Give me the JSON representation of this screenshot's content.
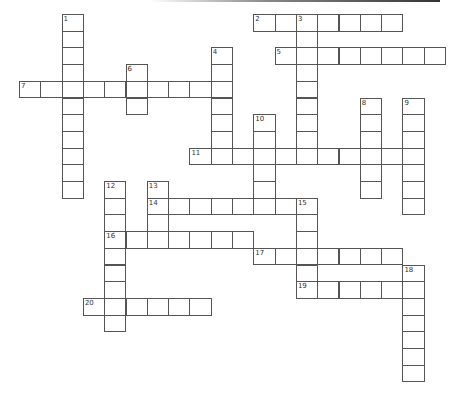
{
  "puzzle": {
    "type": "crossword",
    "grid": {
      "origin_x": 19,
      "origin_y": 14,
      "cell_w": 21.3,
      "cell_h": 16.7
    },
    "colors": {
      "border": "#555555",
      "cell_bg": "#ffffff",
      "number": "#333333"
    },
    "entries": [
      {
        "number": "1",
        "direction": "down",
        "row": 0,
        "col": 2,
        "length": 11
      },
      {
        "number": "2",
        "direction": "across",
        "row": 0,
        "col": 11,
        "length": 7
      },
      {
        "number": "3",
        "direction": "down",
        "row": 0,
        "col": 13,
        "length": 9
      },
      {
        "number": "4",
        "direction": "down",
        "row": 2,
        "col": 9,
        "length": 7
      },
      {
        "number": "5",
        "direction": "across",
        "row": 2,
        "col": 12,
        "length": 8
      },
      {
        "number": "6",
        "direction": "down",
        "row": 3,
        "col": 5,
        "length": 3
      },
      {
        "number": "7",
        "direction": "across",
        "row": 4,
        "col": 0,
        "length": 10
      },
      {
        "number": "8",
        "direction": "down",
        "row": 5,
        "col": 16,
        "length": 6
      },
      {
        "number": "9",
        "direction": "down",
        "row": 5,
        "col": 18,
        "length": 7
      },
      {
        "number": "10",
        "direction": "down",
        "row": 6,
        "col": 11,
        "length": 6
      },
      {
        "number": "11",
        "direction": "across",
        "row": 8,
        "col": 8,
        "length": 11
      },
      {
        "number": "12",
        "direction": "down",
        "row": 10,
        "col": 4,
        "length": 9
      },
      {
        "number": "13",
        "direction": "down",
        "row": 10,
        "col": 6,
        "length": 4
      },
      {
        "number": "14",
        "direction": "across",
        "row": 11,
        "col": 6,
        "length": 8
      },
      {
        "number": "15",
        "direction": "down",
        "row": 11,
        "col": 13,
        "length": 6
      },
      {
        "number": "16",
        "direction": "across",
        "row": 13,
        "col": 4,
        "length": 7
      },
      {
        "number": "17",
        "direction": "across",
        "row": 14,
        "col": 11,
        "length": 7
      },
      {
        "number": "18",
        "direction": "down",
        "row": 15,
        "col": 18,
        "length": 7
      },
      {
        "number": "19",
        "direction": "across",
        "row": 16,
        "col": 13,
        "length": 6
      },
      {
        "number": "20",
        "direction": "across",
        "row": 17,
        "col": 3,
        "length": 6
      }
    ]
  }
}
